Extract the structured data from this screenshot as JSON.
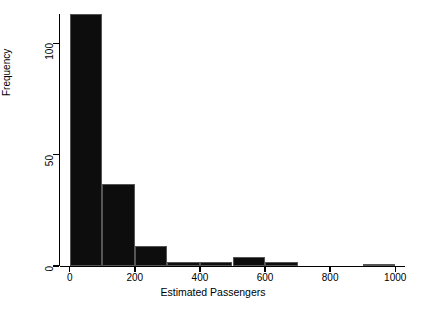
{
  "chart_data": {
    "type": "bar",
    "title": "",
    "subtitle": "",
    "xlabel": "Estimated Passengers",
    "ylabel": "Frequency",
    "grid": false,
    "legend": null,
    "bin_width": 100,
    "xlim": [
      -30,
      1030
    ],
    "ylim": [
      0,
      115
    ],
    "xticks": [
      0,
      200,
      400,
      600,
      800,
      1000
    ],
    "xtick_labels": [
      "0",
      "200",
      "400",
      "600",
      "800",
      "1000"
    ],
    "yticks": [
      0,
      50,
      100
    ],
    "ytick_labels": [
      "0",
      "50",
      "100"
    ],
    "bin_edges": [
      0,
      100,
      200,
      300,
      400,
      500,
      600,
      700,
      800,
      900,
      1000
    ],
    "bin_centers": [
      50,
      150,
      250,
      350,
      450,
      550,
      650,
      750,
      850,
      950
    ],
    "values": [
      113,
      37,
      9,
      2,
      2,
      4,
      2,
      0,
      0,
      1
    ],
    "bar_color": "#0d0d0d",
    "bar_edge_color": "#555555"
  },
  "axes": {
    "y_title": "Frequency",
    "x_title": "Estimated Passengers"
  }
}
